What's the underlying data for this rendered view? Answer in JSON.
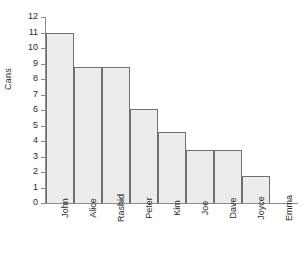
{
  "chart_data": {
    "type": "bar",
    "title": "",
    "xlabel": "",
    "ylabel": "Cans",
    "categories": [
      "John",
      "Alice",
      "Rashid",
      "Peter",
      "Kim",
      "Joe",
      "Dave",
      "Joyce",
      "Emma"
    ],
    "values": [
      11,
      8.8,
      8.8,
      6.05,
      4.6,
      3.4,
      3.4,
      1.75,
      0
    ],
    "ylim": [
      0,
      12
    ],
    "ytick_step": 1,
    "yticks": [
      12,
      11,
      10,
      9,
      8,
      7,
      6,
      5,
      4,
      3,
      2,
      1,
      0
    ],
    "ytick_labels": [
      "12",
      "11",
      "10",
      "9",
      "8",
      "7",
      "6",
      "5",
      "4",
      "3",
      "2",
      "1",
      "0"
    ],
    "grid": false,
    "legend": null,
    "bar_gap": 0,
    "colors": {
      "bar_fill": "#ececec",
      "bar_stroke": "#6f6f6f",
      "axis": "#8a8a8a",
      "text": "#2b2b2b",
      "background": "#ffffff"
    }
  }
}
